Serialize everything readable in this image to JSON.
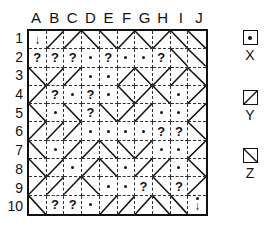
{
  "columns": [
    "A",
    "B",
    "C",
    "D",
    "E",
    "F",
    "G",
    "H",
    "I",
    "J"
  ],
  "rows": [
    "1",
    "2",
    "3",
    "4",
    "5",
    "6",
    "7",
    "8",
    "9",
    "10"
  ],
  "grid": [
    [
      "arrow-down",
      "/",
      "/",
      "\\",
      "\\",
      "/",
      "\\",
      "/",
      "\\",
      "\\"
    ],
    [
      "?",
      "?",
      "?",
      "dot",
      "?",
      "dot",
      "dot",
      "?",
      "\\",
      "\\"
    ],
    [
      "\\",
      "/",
      "/",
      "dot",
      "dot",
      "/",
      "\\",
      "/",
      "/",
      "\\"
    ],
    [
      "/",
      "?",
      "dot",
      "?",
      "dot",
      "\\",
      "/",
      "\\",
      "dot",
      "/"
    ],
    [
      "\\",
      "dot",
      "\\",
      "?",
      "\\",
      "/",
      "/",
      "dot",
      "dot",
      "/"
    ],
    [
      "/",
      "/",
      "/",
      "dot",
      "dot",
      "dot",
      "dot",
      "?",
      "?",
      "\\"
    ],
    [
      "\\",
      "dot",
      "/",
      "/",
      "\\",
      "\\",
      "/",
      "dot",
      "dot",
      "/"
    ],
    [
      "\\",
      "/",
      "dot",
      "/",
      "\\",
      "dot",
      "/",
      "/",
      "dot",
      "\\"
    ],
    [
      "/",
      "/",
      "/",
      "\\",
      "dot",
      "dot",
      "?",
      "\\",
      "?",
      "/"
    ],
    [
      "\\",
      "?",
      "?",
      "dot",
      "/",
      "/",
      "/",
      "\\",
      "\\",
      "arrow-down-dot"
    ]
  ],
  "legend": [
    {
      "key": "X",
      "symbol": "dot"
    },
    {
      "key": "Y",
      "symbol": "/"
    },
    {
      "key": "Z",
      "symbol": "\\"
    }
  ],
  "glyphs": {
    "question": "?",
    "arrow": "↓"
  }
}
